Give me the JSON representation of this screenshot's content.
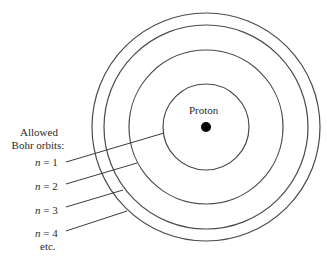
{
  "diagram": {
    "type": "bohr-model",
    "nucleus_label": "Proton",
    "legend_title_line1": "Allowed",
    "legend_title_line2": "Bohr orbits:",
    "orbits": [
      {
        "n_symbol": "n",
        "equals": " = 1"
      },
      {
        "n_symbol": "n",
        "equals": " = 2"
      },
      {
        "n_symbol": "n",
        "equals": " = 3"
      },
      {
        "n_symbol": "n",
        "equals": " = 4"
      }
    ],
    "etc_label": "etc.",
    "colors": {
      "line": "#4a4a4a",
      "nucleus": "#000000",
      "text": "#2a2a2a"
    }
  }
}
